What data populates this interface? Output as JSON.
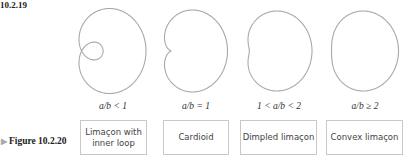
{
  "figure_top_label": "10.2.19",
  "figure_bottom_label": "Figure 10.2.20",
  "figure_bottom_marker": "▶",
  "curve_color": "#a8a8a8",
  "panels": [
    {
      "id": "inner-loop",
      "condition": "a/b < 1",
      "name_line1": "Limaçon with",
      "name_line2": "inner loop"
    },
    {
      "id": "cardioid",
      "condition": "a/b = 1",
      "name_line1": "Cardioid",
      "name_line2": ""
    },
    {
      "id": "dimpled",
      "condition": "1 < a/b < 2",
      "name_line1": "Dimpled limaçon",
      "name_line2": ""
    },
    {
      "id": "convex",
      "condition": "a/b ≥ 2",
      "name_line1": "Convex limaçon",
      "name_line2": ""
    }
  ]
}
